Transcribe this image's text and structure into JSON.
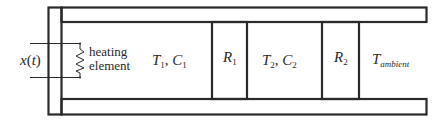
{
  "diagram": {
    "type": "thermal-system-schematic",
    "stroke_color": "#2a2a2a",
    "background": "#ffffff",
    "input": {
      "symbol": "x",
      "argument": "t",
      "open_paren": "(",
      "close_paren": ")"
    },
    "heater": {
      "line1": "heating",
      "line2": "element",
      "icon": "resistor-zigzag-icon"
    },
    "node1": {
      "temp_symbol": "T",
      "temp_sub": "1",
      "separator": ", ",
      "cap_symbol": "C",
      "cap_sub": "1"
    },
    "resistor1": {
      "symbol": "R",
      "sub": "1"
    },
    "node2": {
      "temp_symbol": "T",
      "temp_sub": "2",
      "separator": ", ",
      "cap_symbol": "C",
      "cap_sub": "2"
    },
    "resistor2": {
      "symbol": "R",
      "sub": "2"
    },
    "ambient": {
      "symbol": "T",
      "sub": "ambient"
    }
  }
}
